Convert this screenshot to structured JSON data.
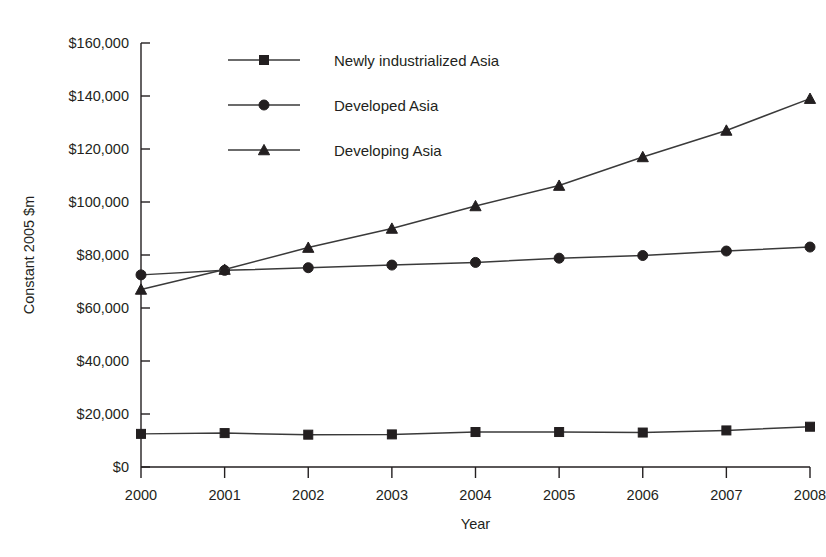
{
  "chart_data": {
    "type": "line",
    "title": "",
    "xlabel": "Year",
    "ylabel": "Constant 2005 $m",
    "categories": [
      "2000",
      "2001",
      "2002",
      "2003",
      "2004",
      "2005",
      "2006",
      "2007",
      "2008"
    ],
    "x": [
      2000,
      2001,
      2002,
      2003,
      2004,
      2005,
      2006,
      2007,
      2008
    ],
    "xlim": [
      2000,
      2008
    ],
    "ylim": [
      0,
      160000
    ],
    "ytick_values": [
      0,
      20000,
      40000,
      60000,
      80000,
      100000,
      120000,
      140000,
      160000
    ],
    "ytick_labels": [
      "$0",
      "$20,000",
      "$40,000",
      "$60,000",
      "$80,000",
      "$100,000",
      "$120,000",
      "$140,000",
      "$160,000"
    ],
    "grid": false,
    "legend_position": "top-center-inside",
    "series": [
      {
        "name": "Newly industrialized Asia",
        "marker": "square",
        "color": "#231f20",
        "values": [
          12500,
          12800,
          12200,
          12300,
          13200,
          13200,
          13000,
          13800,
          15200
        ]
      },
      {
        "name": "Developed Asia",
        "marker": "circle",
        "color": "#231f20",
        "values": [
          72500,
          74200,
          75200,
          76200,
          77200,
          78800,
          79800,
          81500,
          83000
        ]
      },
      {
        "name": "Developing Asia",
        "marker": "triangle",
        "color": "#231f20",
        "values": [
          67000,
          74500,
          82800,
          90000,
          98500,
          106200,
          117000,
          127000,
          139000
        ]
      }
    ]
  },
  "legend": {
    "items": [
      {
        "label": "Newly industrialized Asia",
        "marker": "square"
      },
      {
        "label": "Developed Asia",
        "marker": "circle"
      },
      {
        "label": "Developing Asia",
        "marker": "triangle"
      }
    ]
  },
  "axes": {
    "y_axis_title": "Constant 2005 $m",
    "x_axis_title": "Year"
  }
}
